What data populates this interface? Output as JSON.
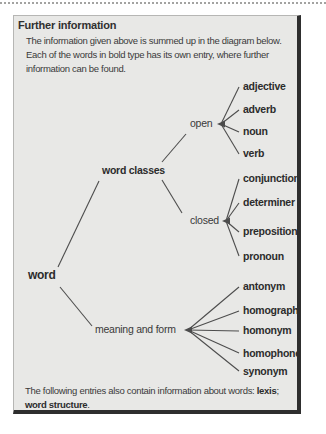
{
  "box": {
    "title": "Further information",
    "intro_lines": [
      "The information given above is summed up in the diagram below.",
      "Each of the words in bold type has its own entry, where further",
      "information can be found."
    ],
    "footer": {
      "prefix": "The following entries also contain information about words: ",
      "ref1": "lexis",
      "separator": ";",
      "ref2": "word structure",
      "end": "."
    }
  },
  "tree": {
    "root": "word",
    "branches": [
      {
        "label": "word classes",
        "children": [
          {
            "label": "open",
            "children": [
              "adjective",
              "adverb",
              "noun",
              "verb"
            ]
          },
          {
            "label": "closed",
            "children": [
              "conjunction",
              "determiner",
              "preposition",
              "pronoun"
            ]
          }
        ]
      },
      {
        "label": "meaning and form",
        "children": [
          "antonym",
          "homograph",
          "homonym",
          "homophone",
          "synonym"
        ]
      }
    ]
  },
  "colors": {
    "box_background": "#e8e8e6",
    "shadow_border": "#2e2e2e",
    "light_border": "#b6b6b4",
    "text": "#3a3a3a",
    "tree_line": "#4d4d4d",
    "page_background": "#ffffff"
  }
}
